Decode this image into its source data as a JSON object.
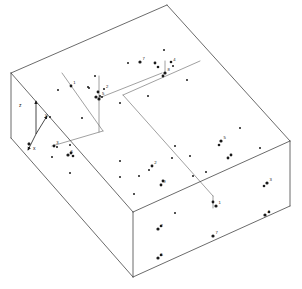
{
  "figure": {
    "background_color": "#ffffff",
    "line_color": "#3a3a3a",
    "interior_line_color": "#6e6e6e",
    "point_color": "#1a1a1a",
    "width": 302,
    "height": 289
  },
  "axes": {
    "origin": [
      38,
      135
    ],
    "items": [
      {
        "name": "z-axis",
        "label": "z",
        "label_pos": [
          19,
          107
        ],
        "from": [
          36,
          134
        ],
        "to": [
          36,
          101
        ]
      },
      {
        "name": "y-axis",
        "label": "y",
        "label_pos": [
          45,
          117
        ],
        "from": [
          36,
          134
        ],
        "to": [
          47,
          116
        ]
      },
      {
        "name": "x-axis",
        "label": "x",
        "label_pos": [
          33,
          150
        ],
        "from": [
          36,
          134
        ],
        "to": [
          28,
          150
        ]
      }
    ]
  },
  "block": {
    "name": "rectangular-block",
    "top_face": [
      [
        11,
        73
      ],
      [
        167,
        5
      ],
      [
        290,
        141
      ],
      [
        133,
        212
      ]
    ],
    "front_left_face": [
      [
        11,
        73
      ],
      [
        133,
        212
      ],
      [
        133,
        277
      ],
      [
        11,
        138
      ]
    ],
    "front_right_face": [
      [
        133,
        212
      ],
      [
        290,
        141
      ],
      [
        290,
        206
      ],
      [
        133,
        277
      ]
    ],
    "top_edges": [
      {
        "from": [
          11,
          73
        ],
        "to": [
          167,
          5
        ]
      },
      {
        "from": [
          167,
          5
        ],
        "to": [
          290,
          141
        ]
      },
      {
        "from": [
          290,
          141
        ],
        "to": [
          133,
          212
        ]
      },
      {
        "from": [
          133,
          212
        ],
        "to": [
          11,
          73
        ]
      }
    ],
    "vertical_edges": [
      {
        "from": [
          11,
          73
        ],
        "to": [
          11,
          138
        ]
      },
      {
        "from": [
          133,
          212
        ],
        "to": [
          133,
          277
        ]
      },
      {
        "from": [
          290,
          141
        ],
        "to": [
          290,
          206
        ]
      }
    ],
    "bottom_edges": [
      {
        "from": [
          11,
          138
        ],
        "to": [
          133,
          277
        ]
      },
      {
        "from": [
          133,
          277
        ],
        "to": [
          290,
          206
        ]
      }
    ]
  },
  "interior_lines": [
    {
      "name": "fault-line-diagonal",
      "from": [
        123,
        95
      ],
      "to": [
        213,
        196
      ]
    },
    {
      "name": "fault-line-mid-horizontal",
      "from": [
        123,
        95
      ],
      "to": [
        200,
        61
      ]
    },
    {
      "name": "notch-vertical-left",
      "from": [
        62,
        73
      ],
      "to": [
        103,
        131
      ]
    },
    {
      "name": "notch-horizontal-bottom",
      "from": [
        103,
        131
      ],
      "to": [
        52,
        146
      ]
    },
    {
      "name": "notch-riser-right",
      "from": [
        99,
        98
      ],
      "to": [
        99,
        132
      ]
    },
    {
      "name": "notch-top-right",
      "from": [
        99,
        98
      ],
      "to": [
        162,
        73
      ]
    },
    {
      "name": "point-stem-cluster",
      "from": [
        99,
        98
      ],
      "to": [
        99,
        76
      ]
    },
    {
      "name": "point-stem-right",
      "from": [
        165,
        73
      ],
      "to": [
        165,
        61
      ]
    },
    {
      "name": "point-stem-low",
      "from": [
        213,
        196
      ],
      "to": [
        213,
        208
      ]
    }
  ],
  "points": {
    "top_face": [
      {
        "x": 164,
        "y": 50,
        "r": 1.0,
        "label": ""
      },
      {
        "x": 128,
        "y": 63,
        "r": 1.0,
        "label": ""
      },
      {
        "x": 140,
        "y": 62,
        "r": 1.6,
        "label": "7"
      },
      {
        "x": 155,
        "y": 63,
        "r": 1.4,
        "label": ""
      },
      {
        "x": 158,
        "y": 67,
        "r": 1.3,
        "label": ""
      },
      {
        "x": 171,
        "y": 62,
        "r": 1.3,
        "label": "4"
      },
      {
        "x": 173,
        "y": 66,
        "r": 1.0,
        "label": ""
      },
      {
        "x": 95,
        "y": 76,
        "r": 1.0,
        "label": ""
      },
      {
        "x": 88,
        "y": 87,
        "r": 1.0,
        "label": ""
      },
      {
        "x": 58,
        "y": 90,
        "r": 1.0,
        "label": ""
      },
      {
        "x": 71,
        "y": 86,
        "r": 1.4,
        "label": "1"
      },
      {
        "x": 89,
        "y": 88,
        "r": 1.0,
        "label": ""
      },
      {
        "x": 104,
        "y": 89,
        "r": 1.0,
        "label": "2"
      },
      {
        "x": 98,
        "y": 92,
        "r": 1.4,
        "label": ""
      },
      {
        "x": 100,
        "y": 96,
        "r": 1.0,
        "label": "5"
      },
      {
        "x": 96,
        "y": 97,
        "r": 1.6,
        "label": ""
      },
      {
        "x": 99,
        "y": 99,
        "r": 1.6,
        "label": ""
      },
      {
        "x": 102,
        "y": 97,
        "r": 1.0,
        "label": ""
      },
      {
        "x": 165,
        "y": 73,
        "r": 1.6,
        "label": "8"
      },
      {
        "x": 163,
        "y": 76,
        "r": 1.4,
        "label": ""
      },
      {
        "x": 187,
        "y": 80,
        "r": 1.0,
        "label": ""
      },
      {
        "x": 120,
        "y": 103,
        "r": 1.0,
        "label": ""
      },
      {
        "x": 148,
        "y": 96,
        "r": 1.0,
        "label": ""
      },
      {
        "x": 82,
        "y": 118,
        "r": 1.0,
        "label": ""
      },
      {
        "x": 50,
        "y": 117,
        "r": 1.0,
        "label": ""
      },
      {
        "x": 54,
        "y": 146,
        "r": 1.4,
        "label": "3"
      },
      {
        "x": 57,
        "y": 147,
        "r": 1.0,
        "label": ""
      },
      {
        "x": 70,
        "y": 145,
        "r": 1.0,
        "label": ""
      },
      {
        "x": 52,
        "y": 157,
        "r": 1.0,
        "label": ""
      },
      {
        "x": 71,
        "y": 153,
        "r": 1.4,
        "label": ""
      },
      {
        "x": 68,
        "y": 155,
        "r": 1.6,
        "label": "6"
      },
      {
        "x": 73,
        "y": 156,
        "r": 1.3,
        "label": ""
      },
      {
        "x": 29,
        "y": 144,
        "r": 1.4,
        "label": ""
      },
      {
        "x": 70,
        "y": 173,
        "r": 1.0,
        "label": ""
      },
      {
        "x": 120,
        "y": 161,
        "r": 1.0,
        "label": ""
      },
      {
        "x": 139,
        "y": 176,
        "r": 1.0,
        "label": ""
      },
      {
        "x": 120,
        "y": 177,
        "r": 1.0,
        "label": ""
      },
      {
        "x": 152,
        "y": 166,
        "r": 1.4,
        "label": "2"
      },
      {
        "x": 149,
        "y": 170,
        "r": 1.0,
        "label": ""
      },
      {
        "x": 163,
        "y": 181,
        "r": 1.4,
        "label": ""
      },
      {
        "x": 161,
        "y": 185,
        "r": 1.4,
        "label": "9"
      },
      {
        "x": 175,
        "y": 146,
        "r": 1.0,
        "label": ""
      },
      {
        "x": 190,
        "y": 156,
        "r": 1.0,
        "label": ""
      },
      {
        "x": 172,
        "y": 158,
        "r": 1.0,
        "label": ""
      },
      {
        "x": 193,
        "y": 176,
        "r": 1.0,
        "label": ""
      },
      {
        "x": 206,
        "y": 172,
        "r": 1.0,
        "label": ""
      },
      {
        "x": 240,
        "y": 128,
        "r": 1.0,
        "label": ""
      },
      {
        "x": 221,
        "y": 141,
        "r": 1.6,
        "label": "5"
      },
      {
        "x": 219,
        "y": 145,
        "r": 1.3,
        "label": ""
      },
      {
        "x": 231,
        "y": 155,
        "r": 1.4,
        "label": ""
      },
      {
        "x": 228,
        "y": 158,
        "r": 1.4,
        "label": ""
      },
      {
        "x": 260,
        "y": 148,
        "r": 1.0,
        "label": ""
      },
      {
        "x": 216,
        "y": 206,
        "r": 1.6,
        "label": "1"
      },
      {
        "x": 213,
        "y": 202,
        "r": 1.4,
        "label": ""
      },
      {
        "x": 134,
        "y": 194,
        "r": 1.0,
        "label": ""
      }
    ],
    "front_right_face": [
      {
        "x": 267,
        "y": 183,
        "r": 1.6,
        "label": "3"
      },
      {
        "x": 264,
        "y": 186,
        "r": 1.3,
        "label": ""
      },
      {
        "x": 265,
        "y": 215,
        "r": 1.6,
        "label": "4"
      },
      {
        "x": 269,
        "y": 212,
        "r": 1.3,
        "label": ""
      },
      {
        "x": 213,
        "y": 236,
        "r": 1.6,
        "label": "7"
      },
      {
        "x": 158,
        "y": 229,
        "r": 1.6,
        "label": "2"
      },
      {
        "x": 161,
        "y": 226,
        "r": 1.3,
        "label": ""
      },
      {
        "x": 158,
        "y": 258,
        "r": 1.6,
        "label": "5"
      },
      {
        "x": 161,
        "y": 255,
        "r": 1.3,
        "label": ""
      },
      {
        "x": 175,
        "y": 213,
        "r": 1.0,
        "label": ""
      }
    ],
    "front_left_face": [
      {
        "x": 29,
        "y": 144,
        "r": 1.3,
        "label": ""
      }
    ]
  }
}
